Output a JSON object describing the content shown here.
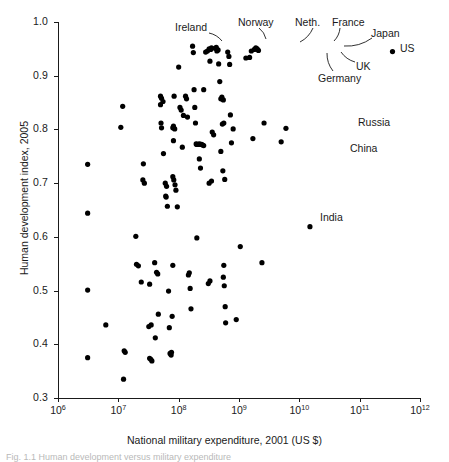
{
  "figure": {
    "caption": "Fig. 1.1  Human development versus military expenditure"
  },
  "chart_data": {
    "type": "scatter",
    "title": "",
    "xlabel": "National military expenditure, 2001 (US $)",
    "ylabel": "Human development index, 2005",
    "xscale": "log",
    "yscale": "linear",
    "xlim": [
      1000000,
      1000000000000
    ],
    "ylim": [
      0.3,
      1.0
    ],
    "grid": false,
    "legend": "none",
    "xticks": [
      {
        "value": 1000000,
        "label": "10",
        "exp": "6"
      },
      {
        "value": 10000000,
        "label": "10",
        "exp": "7"
      },
      {
        "value": 100000000,
        "label": "10",
        "exp": "8"
      },
      {
        "value": 1000000000,
        "label": "10",
        "exp": "9"
      },
      {
        "value": 10000000000,
        "label": "10",
        "exp": "10"
      },
      {
        "value": 100000000000,
        "label": "10",
        "exp": "11"
      },
      {
        "value": 1000000000000,
        "label": "10",
        "exp": "12"
      }
    ],
    "yticks": [
      {
        "value": 0.3,
        "label": "0.3"
      },
      {
        "value": 0.4,
        "label": "0.4"
      },
      {
        "value": 0.5,
        "label": "0.5"
      },
      {
        "value": 0.6,
        "label": "0.6"
      },
      {
        "value": 0.7,
        "label": "0.7"
      },
      {
        "value": 0.8,
        "label": "0.8"
      },
      {
        "value": 0.9,
        "label": "0.9"
      },
      {
        "value": 1.0,
        "label": "1.0"
      }
    ],
    "marker": {
      "shape": "circle",
      "color": "#000000",
      "size_px": 5.2
    },
    "points": [
      [
        3100000.0,
        0.735
      ],
      [
        3100000.0,
        0.644
      ],
      [
        3100000.0,
        0.501
      ],
      [
        3100000.0,
        0.375
      ],
      [
        6200000.0,
        0.436
      ],
      [
        11800000.0,
        0.843
      ],
      [
        11000000.0,
        0.804
      ],
      [
        12500000.0,
        0.388
      ],
      [
        13000000.0,
        0.385
      ],
      [
        12200000.0,
        0.335
      ],
      [
        19500000.0,
        0.601
      ],
      [
        20000000.0,
        0.549
      ],
      [
        21500000.0,
        0.546
      ],
      [
        24000000.0,
        0.516
      ],
      [
        26000000.0,
        0.736
      ],
      [
        25500000.0,
        0.706
      ],
      [
        27000000.0,
        0.7
      ],
      [
        33000000.0,
        0.374
      ],
      [
        34500000.0,
        0.372
      ],
      [
        36000000.0,
        0.369
      ],
      [
        33000000.0,
        0.512
      ],
      [
        35000000.0,
        0.436
      ],
      [
        32000000.0,
        0.433
      ],
      [
        40000000.0,
        0.552
      ],
      [
        43000000.0,
        0.534
      ],
      [
        45000000.0,
        0.531
      ],
      [
        41000000.0,
        0.412
      ],
      [
        46000000.0,
        0.456
      ],
      [
        50000000.0,
        0.862
      ],
      [
        52000000.0,
        0.858
      ],
      [
        55000000.0,
        0.852
      ],
      [
        50000000.0,
        0.846
      ],
      [
        51000000.0,
        0.812
      ],
      [
        52000000.0,
        0.803
      ],
      [
        56000000.0,
        0.755
      ],
      [
        60000000.0,
        0.7
      ],
      [
        63000000.0,
        0.694
      ],
      [
        61000000.0,
        0.676
      ],
      [
        62000000.0,
        0.674
      ],
      [
        65000000.0,
        0.657
      ],
      [
        68000000.0,
        0.499
      ],
      [
        70000000.0,
        0.431
      ],
      [
        72000000.0,
        0.383
      ],
      [
        75000000.0,
        0.38
      ],
      [
        76000000.0,
        0.385
      ],
      [
        80000000.0,
        0.547
      ],
      [
        78000000.0,
        0.452
      ],
      [
        82000000.0,
        0.806
      ],
      [
        80000000.0,
        0.803
      ],
      [
        86000000.0,
        0.801
      ],
      [
        84000000.0,
        0.862
      ],
      [
        82000000.0,
        0.779
      ],
      [
        80000000.0,
        0.712
      ],
      [
        83000000.0,
        0.706
      ],
      [
        87000000.0,
        0.697
      ],
      [
        90000000.0,
        0.687
      ],
      [
        95000000.0,
        0.656
      ],
      [
        100000000.0,
        0.916
      ],
      [
        105000000.0,
        0.841
      ],
      [
        110000000.0,
        0.836
      ],
      [
        115000000.0,
        0.767
      ],
      [
        120000000.0,
        0.826
      ],
      [
        130000000.0,
        0.862
      ],
      [
        135000000.0,
        0.857
      ],
      [
        140000000.0,
        0.823
      ],
      [
        150000000.0,
        0.533
      ],
      [
        145000000.0,
        0.529
      ],
      [
        155000000.0,
        0.504
      ],
      [
        160000000.0,
        0.466
      ],
      [
        170000000.0,
        0.955
      ],
      [
        175000000.0,
        0.943
      ],
      [
        180000000.0,
        0.874
      ],
      [
        185000000.0,
        0.841
      ],
      [
        190000000.0,
        0.812
      ],
      [
        195000000.0,
        0.773
      ],
      [
        200000000.0,
        0.772
      ],
      [
        210000000.0,
        0.772
      ],
      [
        220000000.0,
        0.773
      ],
      [
        230000000.0,
        0.772
      ],
      [
        240000000.0,
        0.772
      ],
      [
        250000000.0,
        0.771
      ],
      [
        260000000.0,
        0.77
      ],
      [
        200000000.0,
        0.598
      ],
      [
        220000000.0,
        0.745
      ],
      [
        230000000.0,
        0.728
      ],
      [
        260000000.0,
        0.874
      ],
      [
        280000000.0,
        0.944
      ],
      [
        300000000.0,
        0.946
      ],
      [
        320000000.0,
        0.95
      ],
      [
        340000000.0,
        0.949
      ],
      [
        350000000.0,
        0.952
      ],
      [
        330000000.0,
        0.927
      ],
      [
        310000000.0,
        0.513
      ],
      [
        330000000.0,
        0.518
      ],
      [
        360000000.0,
        0.795
      ],
      [
        380000000.0,
        0.79
      ],
      [
        350000000.0,
        0.704
      ],
      [
        320000000.0,
        0.7
      ],
      [
        400000000.0,
        0.951
      ],
      [
        420000000.0,
        0.953
      ],
      [
        450000000.0,
        0.948
      ],
      [
        430000000.0,
        0.946
      ],
      [
        460000000.0,
        0.922
      ],
      [
        480000000.0,
        0.889
      ],
      [
        500000000.0,
        0.857
      ],
      [
        520000000.0,
        0.86
      ],
      [
        550000000.0,
        0.855
      ],
      [
        530000000.0,
        0.81
      ],
      [
        560000000.0,
        0.812
      ],
      [
        500000000.0,
        0.759
      ],
      [
        540000000.0,
        0.723
      ],
      [
        580000000.0,
        0.707
      ],
      [
        550000000.0,
        0.525
      ],
      [
        570000000.0,
        0.509
      ],
      [
        560000000.0,
        0.547
      ],
      [
        590000000.0,
        0.47
      ],
      [
        600000000.0,
        0.44
      ],
      [
        650000000.0,
        0.944
      ],
      [
        680000000.0,
        0.936
      ],
      [
        700000000.0,
        0.921
      ],
      [
        720000000.0,
        0.827
      ],
      [
        750000000.0,
        0.775
      ],
      [
        800000000.0,
        0.801
      ],
      [
        900000000.0,
        0.446
      ],
      [
        1050000000.0,
        0.582
      ],
      [
        1300000000.0,
        0.933
      ],
      [
        1500000000.0,
        0.934
      ],
      [
        1600000000.0,
        0.946
      ],
      [
        1800000000.0,
        0.949
      ],
      [
        1900000000.0,
        0.952
      ],
      [
        2000000000.0,
        0.95
      ],
      [
        2100000000.0,
        0.947
      ],
      [
        1700000000.0,
        0.783
      ],
      [
        2400000000.0,
        0.552
      ],
      [
        2600000000.0,
        0.812
      ],
      [
        6000000000.0,
        0.802
      ],
      [
        5000000000.0,
        0.777
      ],
      [
        15000000000.0,
        0.619
      ],
      [
        350000000000.0,
        0.945
      ]
    ],
    "annotations": [
      {
        "label": "Ireland",
        "point": [
          300000000.0,
          0.946
        ],
        "label_x": 175,
        "label_y": 22,
        "leader": [
          [
            209,
            33
          ],
          [
            222,
            41
          ]
        ]
      },
      {
        "label": "Norway",
        "point": [
          420000000.0,
          0.953
        ],
        "label_x": 238,
        "label_y": 17,
        "leader": [
          [
            259,
            28
          ],
          [
            266,
            39
          ]
        ]
      },
      {
        "label": "Neth.",
        "point": [
          650000000.0,
          0.944
        ],
        "label_x": 295,
        "label_y": 17,
        "leader": [
          [
            313,
            28
          ],
          [
            300,
            42
          ]
        ]
      },
      {
        "label": "France",
        "point": [
          1800000000.0,
          0.949
        ],
        "label_x": 332,
        "label_y": 17,
        "leader": [
          [
            340,
            28
          ],
          [
            334,
            41
          ]
        ]
      },
      {
        "label": "Japan",
        "point": [
          2000000000.0,
          0.95
        ],
        "label_x": 371,
        "label_y": 28,
        "leader": [
          [
            372,
            38
          ],
          [
            344,
            46
          ]
        ]
      },
      {
        "label": "US",
        "point": [
          350000000000.0,
          0.945
        ],
        "label_x": 400,
        "label_y": 43,
        "leader": null
      },
      {
        "label": "UK",
        "point": [
          2100000000.0,
          0.947
        ],
        "label_x": 356,
        "label_y": 61,
        "leader": [
          [
            355,
            62
          ],
          [
            341,
            52
          ]
        ]
      },
      {
        "label": "Germany",
        "point": [
          1300000000.0,
          0.933
        ],
        "label_x": 318,
        "label_y": 73,
        "leader": [
          [
            333,
            71
          ],
          [
            327,
            53
          ]
        ]
      },
      {
        "label": "Russia",
        "point": [
          6000000000.0,
          0.802
        ],
        "label_x": 358,
        "label_y": 117,
        "leader": null
      },
      {
        "label": "China",
        "point": [
          5000000000.0,
          0.777
        ],
        "label_x": 350,
        "label_y": 143,
        "leader": null
      },
      {
        "label": "India",
        "point": [
          15000000000.0,
          0.619
        ],
        "label_x": 320,
        "label_y": 212,
        "leader": null
      }
    ]
  }
}
